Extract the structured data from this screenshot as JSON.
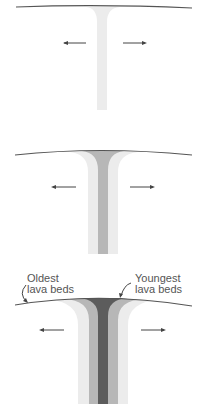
{
  "colors": {
    "surface_line": "#555555",
    "arrow": "#444444",
    "band_oldest": "#ececec",
    "band_middle": "#d7d7d7",
    "band_mid_gray": "#b7b7b7",
    "band_youngest": "#5c5c5c"
  },
  "panels": [
    {
      "stage": 1,
      "bands": 1,
      "arrows": [
        "left",
        "right"
      ]
    },
    {
      "stage": 2,
      "bands": 2,
      "arrows": [
        "left",
        "right"
      ]
    },
    {
      "stage": 3,
      "bands": 3,
      "arrows": [
        "left",
        "right"
      ]
    }
  ],
  "labels": {
    "oldest": "Oldest\nlava beds",
    "youngest": "Youngest\nlava beds"
  }
}
